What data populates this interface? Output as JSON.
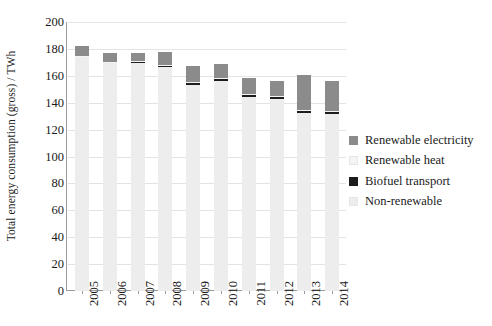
{
  "chart_data": {
    "type": "bar",
    "stacked": true,
    "title": "",
    "xlabel": "",
    "ylabel": "Total energy consumption (gross) / TWh",
    "ylim": [
      0,
      200
    ],
    "yticks": [
      0,
      20,
      40,
      60,
      80,
      100,
      120,
      140,
      160,
      180,
      200
    ],
    "grid": true,
    "legend_position": "right",
    "categories": [
      "2005",
      "2006",
      "2007",
      "2008",
      "2009",
      "2010",
      "2011",
      "2012",
      "2013",
      "2014"
    ],
    "series": [
      {
        "name": "Non-renewable",
        "color": "#ededed",
        "values": [
          174.5,
          170.0,
          170.0,
          166.5,
          153.5,
          156.0,
          144.0,
          143.0,
          132.5,
          131.5
        ]
      },
      {
        "name": "Biofuel transport",
        "color": "#1c1c1c",
        "values": [
          0.3,
          0.4,
          0.6,
          1.6,
          2.0,
          2.0,
          2.0,
          2.0,
          2.0,
          2.0
        ]
      },
      {
        "name": "Renewable heat",
        "color": "#f4f4f4",
        "values": [
          0.2,
          0.2,
          0.2,
          0.2,
          0.2,
          0.2,
          0.2,
          0.2,
          0.2,
          0.2
        ]
      },
      {
        "name": "Renewable electricity",
        "color": "#8b8b8b",
        "values": [
          7.0,
          6.4,
          6.2,
          9.2,
          11.3,
          10.3,
          12.3,
          11.3,
          25.8,
          22.3
        ]
      }
    ],
    "totals": [
      182.0,
      177.0,
      177.0,
      177.5,
      167.0,
      168.5,
      158.5,
      156.5,
      160.5,
      156.0
    ]
  },
  "axis": {
    "y_tick_labels": [
      "200",
      "180",
      "160",
      "140",
      "120",
      "100",
      "80",
      "60",
      "40",
      "20",
      "0"
    ],
    "y_title": "Total energy consumption (gross) / TWh",
    "x_tick_labels": [
      "2005",
      "2006",
      "2007",
      "2008",
      "2009",
      "2010",
      "2011",
      "2012",
      "2013",
      "2014"
    ]
  },
  "legend": {
    "items": [
      {
        "label": "Renewable electricity",
        "color": "#8b8b8b"
      },
      {
        "label": "Renewable heat",
        "color": "#f4f4f4"
      },
      {
        "label": "Biofuel transport",
        "color": "#1c1c1c"
      },
      {
        "label": "Non-renewable",
        "color": "#ededed"
      }
    ]
  }
}
